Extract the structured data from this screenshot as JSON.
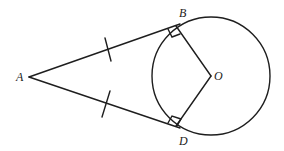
{
  "diagram": {
    "type": "geometry",
    "points": {
      "A": {
        "label": "A",
        "x": 29,
        "y": 77
      },
      "B": {
        "label": "B",
        "x": 176,
        "y": 26
      },
      "D": {
        "label": "D",
        "x": 176,
        "y": 126
      },
      "O": {
        "label": "O",
        "x": 211,
        "y": 76
      }
    },
    "circle": {
      "center": "O",
      "cx": 211,
      "cy": 76,
      "r": 59
    },
    "segments": [
      {
        "from": "A",
        "to": "B",
        "tick_marks": 1
      },
      {
        "from": "A",
        "to": "D",
        "tick_marks": 1
      },
      {
        "from": "B",
        "to": "O",
        "tick_marks": 0
      },
      {
        "from": "D",
        "to": "O",
        "tick_marks": 0
      }
    ],
    "right_angles": [
      "B",
      "D"
    ],
    "stroke_color": "#1e1e1e",
    "background_color": "#ffffff"
  }
}
